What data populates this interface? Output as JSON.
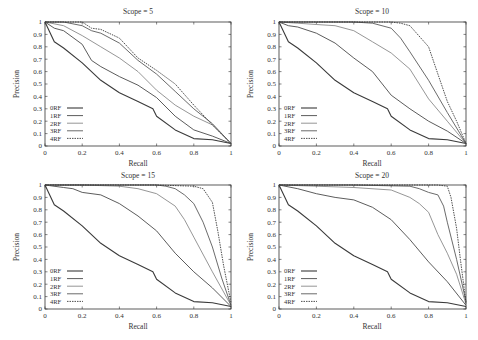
{
  "figure": {
    "layout": "2x2 grid",
    "line_color": "#555555"
  },
  "chart_data": [
    {
      "type": "line",
      "title": "Scope = 5",
      "xlabel": "Recall",
      "ylabel": "Precision",
      "xlim": [
        0,
        1
      ],
      "ylim": [
        0,
        1
      ],
      "xticks": [
        "0",
        "0.2",
        "0.4",
        "0.6",
        "0.8",
        "1"
      ],
      "yticks": [
        "0",
        "0.1",
        "0.2",
        "0.3",
        "0.4",
        "0.5",
        "0.6",
        "0.7",
        "0.8",
        "0.9",
        "1"
      ],
      "grid": false,
      "legend_position": "lower left",
      "series": [
        {
          "name": "0RF",
          "x": [
            0,
            0.05,
            0.1,
            0.2,
            0.3,
            0.4,
            0.5,
            0.58,
            0.6,
            0.7,
            0.8,
            0.9,
            1.0
          ],
          "y": [
            1,
            0.84,
            0.79,
            0.67,
            0.53,
            0.43,
            0.36,
            0.3,
            0.24,
            0.13,
            0.06,
            0.05,
            0.02
          ]
        },
        {
          "name": "1RF",
          "x": [
            0,
            0.05,
            0.1,
            0.2,
            0.25,
            0.3,
            0.4,
            0.5,
            0.6,
            0.7,
            0.8,
            0.9,
            1.0
          ],
          "y": [
            1,
            0.95,
            0.93,
            0.82,
            0.69,
            0.64,
            0.56,
            0.49,
            0.39,
            0.24,
            0.13,
            0.08,
            0.02
          ]
        },
        {
          "name": "2RF",
          "x": [
            0,
            0.1,
            0.2,
            0.3,
            0.4,
            0.5,
            0.6,
            0.7,
            0.8,
            0.9,
            1.0
          ],
          "y": [
            1,
            0.97,
            0.89,
            0.8,
            0.71,
            0.6,
            0.45,
            0.33,
            0.24,
            0.17,
            0.02
          ]
        },
        {
          "name": "3RF",
          "x": [
            0,
            0.1,
            0.2,
            0.25,
            0.3,
            0.4,
            0.5,
            0.6,
            0.7,
            0.8,
            0.9,
            1.0
          ],
          "y": [
            1,
            1.0,
            0.97,
            0.93,
            0.91,
            0.83,
            0.69,
            0.58,
            0.44,
            0.3,
            0.18,
            0.02
          ]
        },
        {
          "name": "4RF",
          "x": [
            0,
            0.1,
            0.2,
            0.25,
            0.3,
            0.4,
            0.5,
            0.6,
            0.7,
            0.8,
            0.9,
            1.0
          ],
          "y": [
            1,
            1.0,
            1.0,
            0.95,
            0.94,
            0.87,
            0.71,
            0.61,
            0.5,
            0.33,
            0.17,
            0.02
          ]
        }
      ]
    },
    {
      "type": "line",
      "title": "Scope = 10",
      "xlabel": "Recall",
      "ylabel": "Precision",
      "xlim": [
        0,
        1
      ],
      "ylim": [
        0,
        1
      ],
      "xticks": [
        "0",
        "0.2",
        "0.4",
        "0.6",
        "0.8",
        "1"
      ],
      "yticks": [
        "0",
        "0.1",
        "0.2",
        "0.3",
        "0.4",
        "0.5",
        "0.6",
        "0.7",
        "0.8",
        "0.9",
        "1"
      ],
      "grid": false,
      "legend_position": "lower left",
      "series": [
        {
          "name": "0RF",
          "x": [
            0,
            0.05,
            0.1,
            0.2,
            0.3,
            0.4,
            0.5,
            0.58,
            0.6,
            0.7,
            0.8,
            0.9,
            1.0
          ],
          "y": [
            1,
            0.84,
            0.79,
            0.67,
            0.53,
            0.43,
            0.36,
            0.3,
            0.24,
            0.13,
            0.06,
            0.05,
            0.02
          ]
        },
        {
          "name": "1RF",
          "x": [
            0,
            0.05,
            0.1,
            0.2,
            0.3,
            0.4,
            0.5,
            0.6,
            0.7,
            0.8,
            0.9,
            1.0
          ],
          "y": [
            1,
            0.97,
            0.96,
            0.91,
            0.83,
            0.71,
            0.6,
            0.41,
            0.3,
            0.2,
            0.12,
            0.02
          ]
        },
        {
          "name": "2RF",
          "x": [
            0,
            0.1,
            0.2,
            0.3,
            0.4,
            0.5,
            0.6,
            0.7,
            0.8,
            0.9,
            1.0
          ],
          "y": [
            1,
            0.99,
            0.98,
            0.97,
            0.93,
            0.84,
            0.75,
            0.62,
            0.38,
            0.2,
            0.02
          ]
        },
        {
          "name": "3RF",
          "x": [
            0,
            0.2,
            0.4,
            0.5,
            0.6,
            0.65,
            0.7,
            0.8,
            0.9,
            1.0
          ],
          "y": [
            1,
            1.0,
            1.0,
            0.99,
            0.95,
            0.87,
            0.76,
            0.53,
            0.27,
            0.02
          ]
        },
        {
          "name": "4RF",
          "x": [
            0,
            0.4,
            0.6,
            0.65,
            0.7,
            0.8,
            0.85,
            0.9,
            0.95,
            1.0
          ],
          "y": [
            1,
            1.0,
            1.0,
            0.99,
            0.97,
            0.8,
            0.58,
            0.36,
            0.2,
            0.02
          ]
        }
      ]
    },
    {
      "type": "line",
      "title": "Scope = 15",
      "xlabel": "Recall",
      "ylabel": "Precision",
      "xlim": [
        0,
        1
      ],
      "ylim": [
        0,
        1
      ],
      "xticks": [
        "0",
        "0.2",
        "0.4",
        "0.6",
        "0.8",
        "1"
      ],
      "yticks": [
        "0",
        "0.1",
        "0.2",
        "0.3",
        "0.4",
        "0.5",
        "0.6",
        "0.7",
        "0.8",
        "0.9",
        "1"
      ],
      "grid": false,
      "legend_position": "lower left",
      "series": [
        {
          "name": "0RF",
          "x": [
            0,
            0.05,
            0.1,
            0.2,
            0.3,
            0.4,
            0.5,
            0.58,
            0.6,
            0.7,
            0.8,
            0.9,
            1.0
          ],
          "y": [
            1,
            0.84,
            0.79,
            0.67,
            0.53,
            0.43,
            0.36,
            0.3,
            0.24,
            0.13,
            0.06,
            0.05,
            0.02
          ]
        },
        {
          "name": "1RF",
          "x": [
            0,
            0.1,
            0.15,
            0.2,
            0.3,
            0.4,
            0.5,
            0.6,
            0.7,
            0.8,
            0.9,
            1.0
          ],
          "y": [
            1,
            0.98,
            0.97,
            0.94,
            0.92,
            0.85,
            0.75,
            0.63,
            0.45,
            0.3,
            0.17,
            0.02
          ]
        },
        {
          "name": "2RF",
          "x": [
            0,
            0.2,
            0.4,
            0.5,
            0.6,
            0.7,
            0.75,
            0.8,
            0.9,
            1.0
          ],
          "y": [
            1,
            1.0,
            0.99,
            0.97,
            0.93,
            0.83,
            0.72,
            0.58,
            0.3,
            0.03
          ]
        },
        {
          "name": "3RF",
          "x": [
            0,
            0.4,
            0.6,
            0.65,
            0.7,
            0.75,
            0.8,
            0.85,
            0.9,
            0.95,
            1.0
          ],
          "y": [
            1,
            1.0,
            1.0,
            0.99,
            0.97,
            0.92,
            0.85,
            0.7,
            0.5,
            0.25,
            0.03
          ]
        },
        {
          "name": "4RF",
          "x": [
            0,
            0.6,
            0.8,
            0.85,
            0.9,
            0.93,
            0.96,
            1.0
          ],
          "y": [
            1,
            1.0,
            0.99,
            0.97,
            0.86,
            0.62,
            0.35,
            0.05
          ]
        }
      ]
    },
    {
      "type": "line",
      "title": "Scope = 20",
      "xlabel": "Recall",
      "ylabel": "Precision",
      "xlim": [
        0,
        1
      ],
      "ylim": [
        0,
        1
      ],
      "xticks": [
        "0",
        "0.2",
        "0.4",
        "0.6",
        "0.8",
        "1"
      ],
      "yticks": [
        "0",
        "0.1",
        "0.2",
        "0.3",
        "0.4",
        "0.5",
        "0.6",
        "0.7",
        "0.8",
        "0.9",
        "1"
      ],
      "grid": false,
      "legend_position": "lower left",
      "series": [
        {
          "name": "0RF",
          "x": [
            0,
            0.05,
            0.1,
            0.2,
            0.3,
            0.4,
            0.5,
            0.58,
            0.6,
            0.7,
            0.8,
            0.9,
            1.0
          ],
          "y": [
            1,
            0.84,
            0.79,
            0.67,
            0.53,
            0.43,
            0.36,
            0.3,
            0.24,
            0.13,
            0.06,
            0.05,
            0.02
          ]
        },
        {
          "name": "1RF",
          "x": [
            0,
            0.1,
            0.2,
            0.3,
            0.4,
            0.5,
            0.6,
            0.7,
            0.8,
            0.9,
            1.0
          ],
          "y": [
            1,
            0.97,
            0.93,
            0.9,
            0.88,
            0.82,
            0.72,
            0.56,
            0.38,
            0.22,
            0.03
          ]
        },
        {
          "name": "2RF",
          "x": [
            0,
            0.2,
            0.4,
            0.6,
            0.7,
            0.75,
            0.8,
            0.85,
            0.9,
            0.95,
            1.0
          ],
          "y": [
            1,
            0.99,
            0.98,
            0.96,
            0.9,
            0.85,
            0.78,
            0.6,
            0.45,
            0.28,
            0.04
          ]
        },
        {
          "name": "3RF",
          "x": [
            0,
            0.4,
            0.7,
            0.75,
            0.8,
            0.85,
            0.88,
            0.9,
            0.95,
            1.0
          ],
          "y": [
            1,
            1.0,
            0.99,
            0.97,
            0.94,
            0.92,
            0.83,
            0.7,
            0.4,
            0.06
          ]
        },
        {
          "name": "4RF",
          "x": [
            0,
            0.6,
            0.85,
            0.9,
            0.92,
            0.95,
            0.97,
            1.0
          ],
          "y": [
            1,
            1.0,
            1.0,
            0.99,
            0.9,
            0.65,
            0.4,
            0.05
          ]
        }
      ]
    }
  ]
}
